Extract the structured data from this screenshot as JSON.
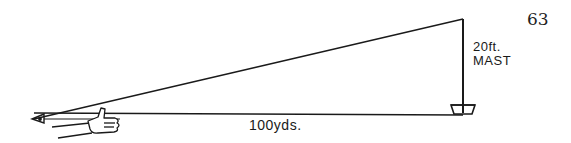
{
  "page": {
    "number": "63"
  },
  "diagram": {
    "title": "",
    "mast": {
      "height_label": "20ft.",
      "name_label": "MAST"
    },
    "baseline": {
      "distance_label": "100yds."
    },
    "elements": {
      "observer": "eye-with-outstretched-hand-thumb-up",
      "target": "boat-with-mast"
    },
    "colors": {
      "ink": "#1a1a1a",
      "background": "#ffffff"
    }
  }
}
